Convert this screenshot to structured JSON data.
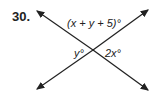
{
  "problem": {
    "number": "30.",
    "labels": {
      "top": "(x + y + 5)°",
      "left": "y°",
      "right": "2x°"
    }
  },
  "colors": {
    "line": "#222222",
    "text": "#222222"
  }
}
